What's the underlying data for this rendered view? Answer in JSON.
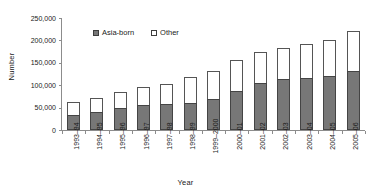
{
  "chart_data": {
    "type": "bar",
    "stacked": true,
    "title": "",
    "xlabel": "Year",
    "ylabel": "Number",
    "ylim": [
      0,
      250000
    ],
    "ytick_values": [
      250000,
      200000,
      150000,
      100000,
      50000,
      0
    ],
    "ytick_labels": [
      "250,000",
      "200,000",
      "150,000",
      "100,000",
      "50,000",
      "0"
    ],
    "grid": false,
    "legend_position": "upper-left-inside",
    "categories": [
      "1993–94",
      "1994–95",
      "1995–96",
      "1996–97",
      "1997–98",
      "1998–99",
      "1999–2000",
      "2000–01",
      "2001–02",
      "2002–03",
      "2003–04",
      "2004–05",
      "2005–06"
    ],
    "series": [
      {
        "name": "Asia-born",
        "color": "#777777",
        "values": [
          34000,
          41000,
          50000,
          56000,
          58000,
          60000,
          69000,
          87000,
          106000,
          114000,
          115000,
          120000,
          131000
        ]
      },
      {
        "name": "Other",
        "color": "#ffffff",
        "values": [
          28000,
          30000,
          34000,
          39000,
          44000,
          59000,
          63000,
          70000,
          69000,
          69000,
          76000,
          81000,
          91000
        ]
      }
    ],
    "totals": [
      62000,
      71000,
      84000,
      95000,
      102000,
      119000,
      132000,
      157000,
      175000,
      183000,
      191000,
      201000,
      222000
    ]
  },
  "legend": {
    "items": [
      {
        "label": "Asia-born",
        "swatch": "filled-grey-square"
      },
      {
        "label": "Other",
        "swatch": "open-white-square"
      }
    ]
  },
  "axes": {
    "y_title": "Number",
    "x_title": "Year"
  }
}
